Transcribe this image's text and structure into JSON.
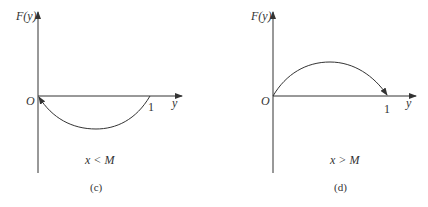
{
  "figures": [
    {
      "id": "c",
      "y_axis_label": "F(y)",
      "x_axis_label": "y",
      "origin_label": "O",
      "tick_label": "1",
      "condition": "x < M",
      "caption": "(c)",
      "curve": "concave-up arc below axis from O to 1, arrow at O"
    },
    {
      "id": "d",
      "y_axis_label": "F(y)",
      "x_axis_label": "y",
      "origin_label": "O",
      "tick_label": "1",
      "condition": "x > M",
      "caption": "(d)",
      "curve": "concave-down arc above axis from O to 1, arrow at 1"
    }
  ],
  "colors": {
    "line": "#333333",
    "background": "#ffffff"
  }
}
